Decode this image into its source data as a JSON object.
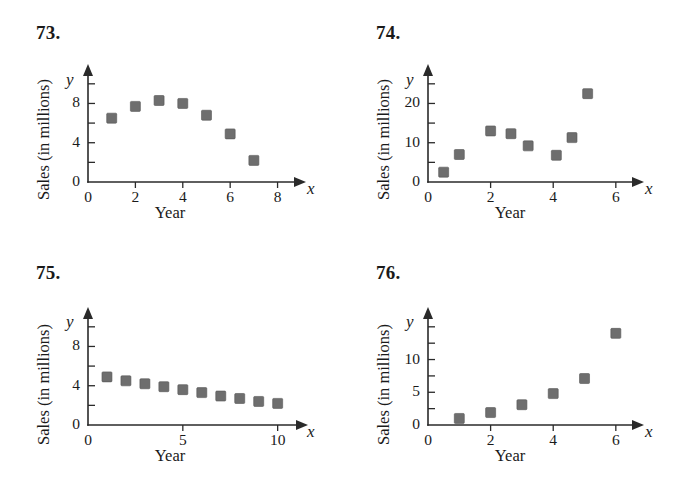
{
  "page": {
    "background": "#ffffff",
    "marker_color": "#6e6e6e",
    "axis_color": "#2a2a2a"
  },
  "panels": [
    {
      "number": "73.",
      "ylabel": "Sales (in millions)",
      "xlabel": "Year",
      "x_axis_letter": "x",
      "y_axis_letter": "y",
      "x_ticks": [
        "0",
        "2",
        "4",
        "6",
        "8"
      ],
      "y_ticks": [
        "0",
        "4",
        "8"
      ]
    },
    {
      "number": "74.",
      "ylabel": "Sales (in millions)",
      "xlabel": "Year",
      "x_axis_letter": "x",
      "y_axis_letter": "y",
      "x_ticks": [
        "0",
        "2",
        "4",
        "6"
      ],
      "y_ticks": [
        "0",
        "10",
        "20"
      ]
    },
    {
      "number": "75.",
      "ylabel": "Sales (in millions)",
      "xlabel": "Year",
      "x_axis_letter": "x",
      "y_axis_letter": "y",
      "x_ticks": [
        "0",
        "5",
        "10"
      ],
      "y_ticks": [
        "0",
        "4",
        "8"
      ]
    },
    {
      "number": "76.",
      "ylabel": "Sales (in millions)",
      "xlabel": "Year",
      "x_axis_letter": "x",
      "y_axis_letter": "y",
      "x_ticks": [
        "0",
        "2",
        "4",
        "6"
      ],
      "y_ticks": [
        "0",
        "5",
        "10"
      ]
    }
  ],
  "chart_data": [
    {
      "type": "scatter",
      "title": "73.",
      "xlabel": "Year",
      "ylabel": "Sales (in millions)",
      "x": [
        1,
        2,
        3,
        4,
        5,
        6,
        7
      ],
      "y": [
        6.5,
        7.7,
        8.3,
        8.0,
        6.8,
        4.9,
        2.2
      ],
      "xlim": [
        0,
        9.2
      ],
      "ylim": [
        0,
        11
      ],
      "x_major_ticks": [
        0,
        2,
        4,
        6,
        8
      ],
      "x_tick_labels": [
        "0",
        "2",
        "4",
        "6",
        "8"
      ],
      "y_major_ticks": [
        0,
        4,
        8
      ],
      "y_tick_labels": [
        "0",
        "4",
        "8"
      ],
      "y_minor_ticks": [
        2,
        6,
        10
      ],
      "grid": false,
      "legend": null,
      "marker": "square"
    },
    {
      "type": "scatter",
      "title": "74.",
      "xlabel": "Year",
      "ylabel": "Sales (in millions)",
      "x": [
        0.5,
        1.0,
        2.0,
        2.65,
        3.2,
        4.1,
        4.6,
        5.1
      ],
      "y": [
        2.5,
        7.0,
        13.0,
        12.3,
        9.2,
        6.8,
        11.3,
        22.5
      ],
      "xlim": [
        0,
        6.9
      ],
      "ylim": [
        0,
        27.5
      ],
      "x_major_ticks": [
        0,
        2,
        4,
        6
      ],
      "x_tick_labels": [
        "0",
        "2",
        "4",
        "6"
      ],
      "y_major_ticks": [
        0,
        10,
        20
      ],
      "y_tick_labels": [
        "0",
        "10",
        "20"
      ],
      "y_minor_ticks": [
        5,
        15,
        25
      ],
      "grid": false,
      "legend": null,
      "marker": "square"
    },
    {
      "type": "scatter",
      "title": "75.",
      "xlabel": "Year",
      "ylabel": "Sales (in millions)",
      "x": [
        1,
        2,
        3,
        4,
        5,
        6,
        7,
        8,
        9,
        10
      ],
      "y": [
        4.9,
        4.5,
        4.2,
        3.9,
        3.6,
        3.3,
        2.95,
        2.7,
        2.4,
        2.2
      ],
      "xlim": [
        0,
        11.6
      ],
      "ylim": [
        0,
        11
      ],
      "x_major_ticks": [
        0,
        5,
        10
      ],
      "x_tick_labels": [
        "0",
        "5",
        "10"
      ],
      "y_major_ticks": [
        0,
        4,
        8
      ],
      "y_tick_labels": [
        "0",
        "4",
        "8"
      ],
      "y_minor_ticks": [
        2,
        6,
        10
      ],
      "grid": false,
      "legend": null,
      "marker": "square"
    },
    {
      "type": "scatter",
      "title": "76.",
      "xlabel": "Year",
      "ylabel": "Sales (in millions)",
      "x": [
        1,
        2,
        3,
        4,
        5,
        6
      ],
      "y": [
        1.0,
        1.9,
        3.1,
        4.8,
        7.1,
        14.0
      ],
      "xlim": [
        0,
        6.9
      ],
      "ylim": [
        0,
        16.5
      ],
      "x_major_ticks": [
        0,
        2,
        4,
        6
      ],
      "x_tick_labels": [
        "0",
        "2",
        "4",
        "6"
      ],
      "y_major_ticks": [
        0,
        5,
        10
      ],
      "y_tick_labels": [
        "0",
        "5",
        "10"
      ],
      "y_minor_ticks": [
        2.5,
        7.5,
        12.5,
        15
      ],
      "grid": false,
      "legend": null,
      "marker": "square"
    }
  ]
}
